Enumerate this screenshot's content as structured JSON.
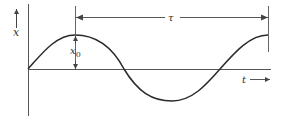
{
  "diagram": {
    "title": "",
    "type": "sinusoid-period-amplitude",
    "labels": {
      "y_axis": "x",
      "x_axis": "t",
      "amplitude": "x",
      "amplitude_subscript": "0",
      "period": "τ"
    },
    "colors": {
      "stroke": "#2a2a2a",
      "axis": "#555555",
      "text": "#333333"
    }
  }
}
